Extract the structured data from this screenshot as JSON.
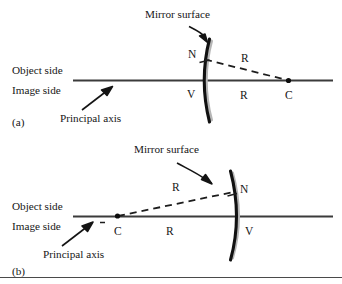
{
  "figure": {
    "title_implicit": "Spherical mirror sign convention diagram",
    "panels": [
      {
        "id": "a",
        "panel_label": "(a)",
        "mirror_surface_label": "Mirror surface",
        "object_side_label": "Object side",
        "image_side_label": "Image side",
        "principal_axis_label": "Principal axis",
        "point_n": "N",
        "point_v": "V",
        "point_c": "C",
        "radius_label_oblique": "R",
        "radius_label_axis": "R",
        "mirror_type": "convex-to-left",
        "center_side": "right"
      },
      {
        "id": "b",
        "panel_label": "(b)",
        "mirror_surface_label": "Mirror surface",
        "object_side_label": "Object side",
        "image_side_label": "Image side",
        "principal_axis_label": "Principal axis",
        "point_n": "N",
        "point_v": "V",
        "point_c": "C",
        "radius_label_oblique": "R",
        "radius_label_axis": "R",
        "mirror_type": "concave-to-left",
        "center_side": "left"
      }
    ],
    "colors": {
      "ink": "#161616",
      "axis": "#3b3b3b",
      "mirror": "#111111",
      "mirror_shadow": "#b6b6b6",
      "background": "#ffffff",
      "frame": "#4a4a4a"
    }
  }
}
